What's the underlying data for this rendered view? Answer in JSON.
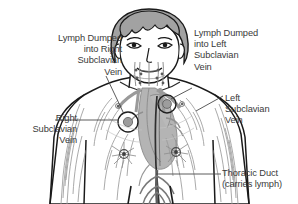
{
  "figure": {
    "labels": {
      "dumped_right": "Lymph Dumped\ninto Right\nSubclavian\nVein",
      "dumped_left": "Lymph Dumped\ninto Left\nSubclavian\nVein",
      "left_subclavian": "Left\nSubclavian\nVein",
      "right_subclavian": "Right\nSubclavian\nVein",
      "thoracic_duct": "Thoracic Duct\n(carries lymph)"
    },
    "colors": {
      "text": "#3a3a3a",
      "outline": "#1a1a1a",
      "leader": "#4a4a4a",
      "hair": "#a2a2a2",
      "skin": "#ffffff",
      "vessel_gray": "#9a9a9a",
      "vessel_dark": "#5d5d5d",
      "organ_fill": "#b4b4b4",
      "node_dark": "#3d3d3d",
      "background": "#ffffff"
    },
    "parts": [
      "head-with-gray-hair",
      "face-eyes-nose-mouth",
      "neck-cervical-lymph-chains",
      "right-subclavian-junction-circle",
      "left-subclavian-junction-circle",
      "thoracic-duct-vertical-vessel",
      "heart-and-great-vessels",
      "axillary-lymph-node-rosette-right",
      "axillary-lymph-node-rosette-left",
      "arm-lymphatic-vessel-network-right",
      "arm-lymphatic-vessel-network-left",
      "abdominal-vessel-branching",
      "torso-outline",
      "arms-outline",
      "legs-outline"
    ]
  }
}
